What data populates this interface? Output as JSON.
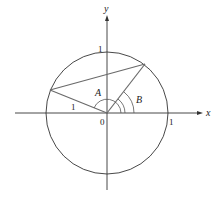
{
  "diagram": {
    "type": "unit-circle",
    "axes": {
      "x_label": "x",
      "y_label": "y"
    },
    "tick_labels": {
      "origin": "0",
      "x_one": "1",
      "y_one": "1"
    },
    "segment_label": "1",
    "angles": [
      {
        "name": "A"
      },
      {
        "name": "B"
      }
    ],
    "colors": {
      "axis": "#333333",
      "circle": "#333333",
      "segment": "#6a6a6a"
    }
  }
}
